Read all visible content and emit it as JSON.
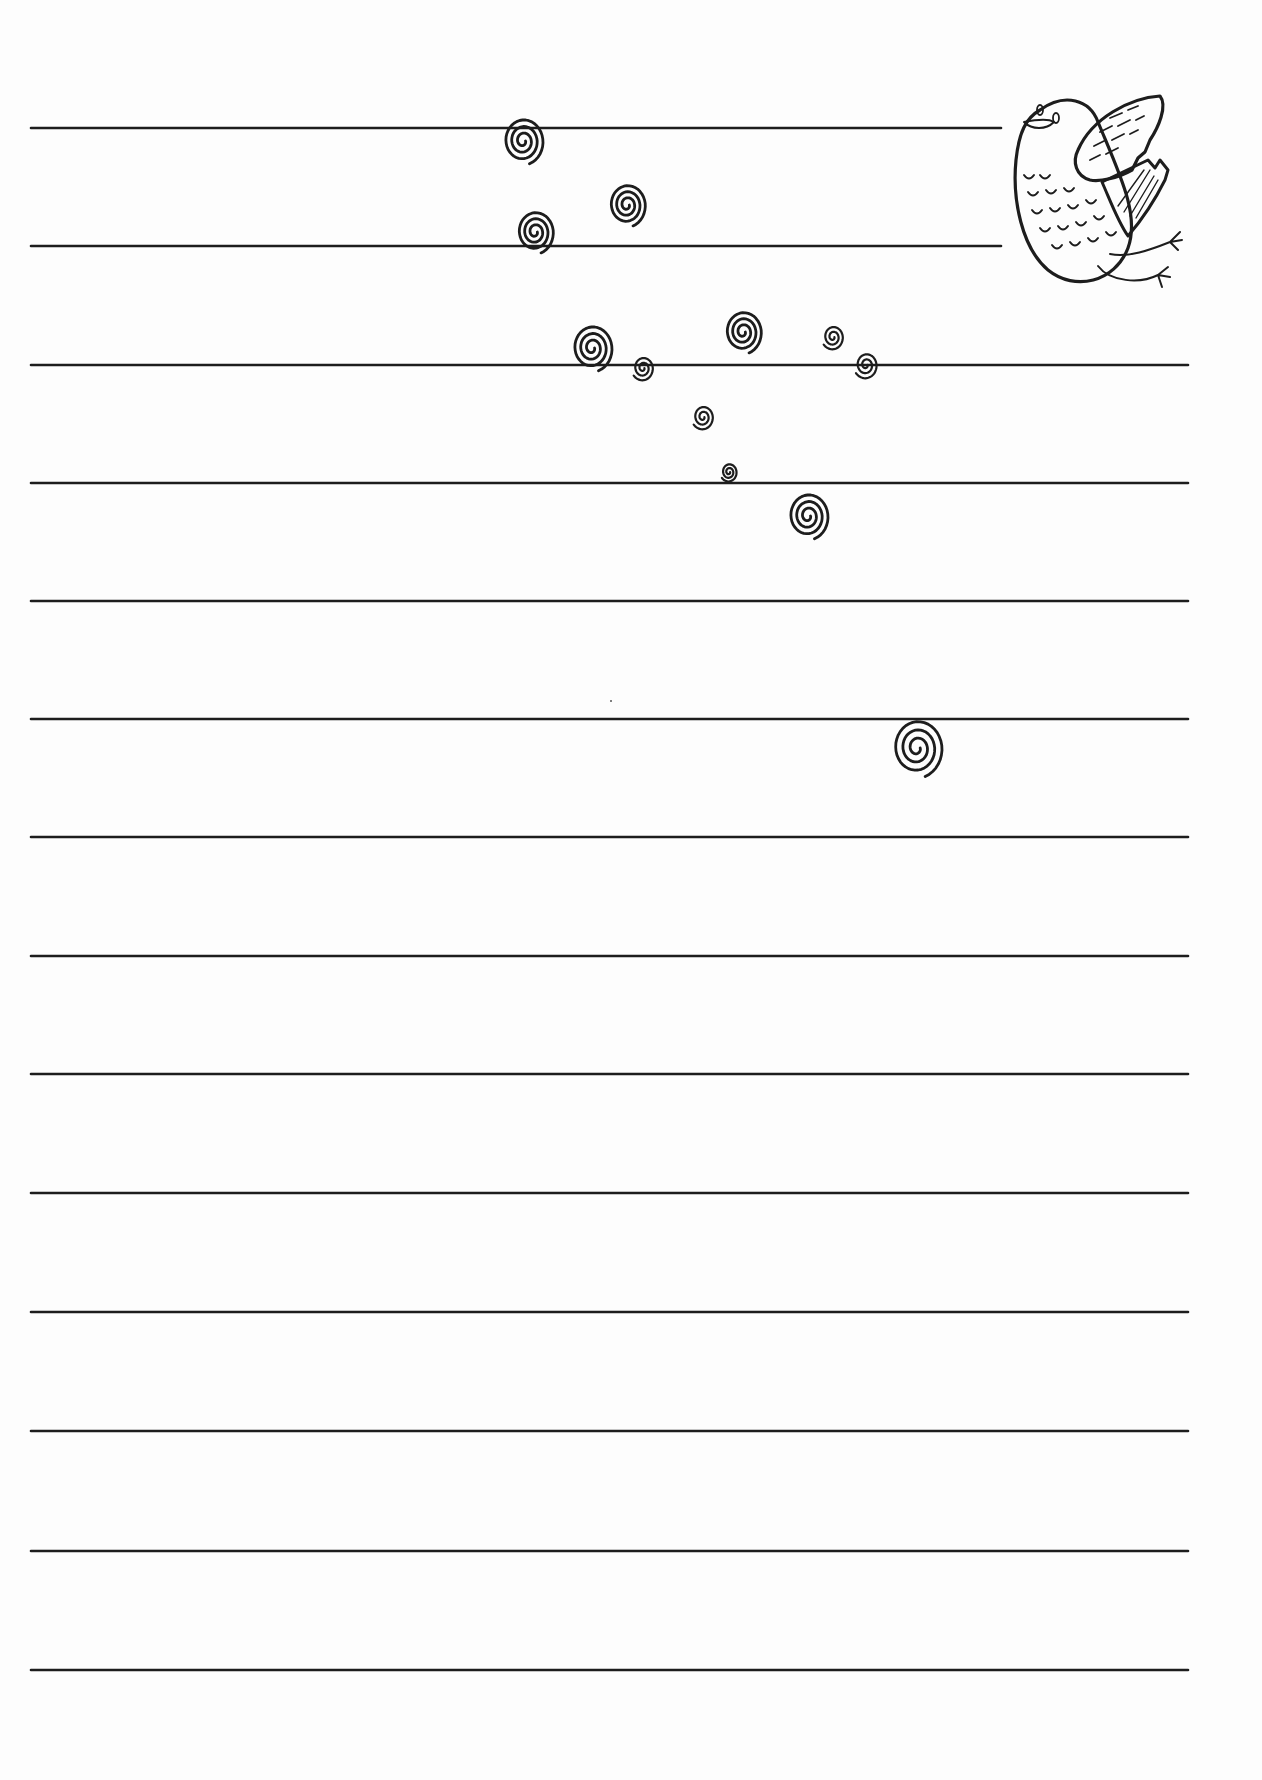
{
  "page": {
    "type": "lined-writing-paper",
    "background": "#fdfdfd",
    "ink_color": "#1d1d1d"
  },
  "rules": {
    "left_x": 31,
    "count": 14,
    "lines": [
      {
        "y": 128,
        "x2": 1001
      },
      {
        "y": 246,
        "x2": 1001
      },
      {
        "y": 365,
        "x2": 1188
      },
      {
        "y": 483,
        "x2": 1188
      },
      {
        "y": 601,
        "x2": 1188
      },
      {
        "y": 719,
        "x2": 1188
      },
      {
        "y": 837,
        "x2": 1188
      },
      {
        "y": 956,
        "x2": 1188
      },
      {
        "y": 1074,
        "x2": 1188
      },
      {
        "y": 1193,
        "x2": 1188
      },
      {
        "y": 1312,
        "x2": 1188
      },
      {
        "y": 1431,
        "x2": 1188
      },
      {
        "y": 1551,
        "x2": 1188
      },
      {
        "y": 1670,
        "x2": 1188
      }
    ]
  },
  "decorations": {
    "bird": {
      "icon": "bird-icon",
      "x": 1010,
      "y": 92,
      "w": 190,
      "h": 210
    },
    "spirals": [
      {
        "cx": 523,
        "cy": 141,
        "r": 24
      },
      {
        "cx": 627,
        "cy": 205,
        "r": 22
      },
      {
        "cx": 535,
        "cy": 232,
        "r": 22
      },
      {
        "cx": 592,
        "cy": 348,
        "r": 24
      },
      {
        "cx": 643,
        "cy": 368,
        "r": 13
      },
      {
        "cx": 743,
        "cy": 332,
        "r": 22
      },
      {
        "cx": 833,
        "cy": 337,
        "r": 13
      },
      {
        "cx": 866,
        "cy": 365,
        "r": 14
      },
      {
        "cx": 703,
        "cy": 417,
        "r": 13
      },
      {
        "cx": 729,
        "cy": 472,
        "r": 10
      },
      {
        "cx": 808,
        "cy": 516,
        "r": 24
      },
      {
        "cx": 917,
        "cy": 748,
        "r": 30
      }
    ],
    "stray_dot": {
      "x": 610,
      "y": 700
    }
  }
}
